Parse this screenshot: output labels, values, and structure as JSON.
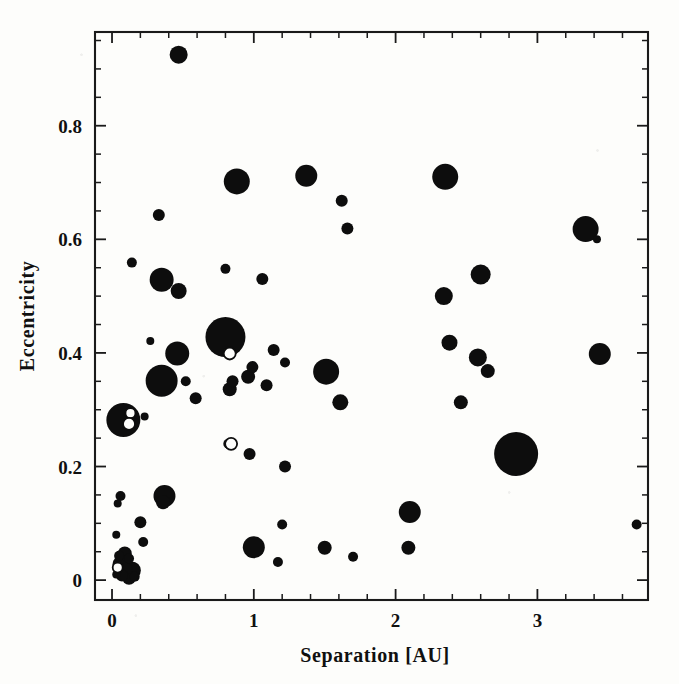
{
  "figure": {
    "background_color": "#fdfdfb",
    "ink_color": "#0d0d0d"
  },
  "chart_data": {
    "type": "scatter",
    "title": "",
    "xlabel": "Separation [AU]",
    "ylabel": "Eccentricity",
    "xlim": [
      -0.12,
      3.78
    ],
    "ylim": [
      -0.035,
      0.965
    ],
    "grid": false,
    "legend": null,
    "x_tick_labels": [
      "0",
      "1",
      "2",
      "3"
    ],
    "x_tick_values": [
      0,
      1,
      2,
      3
    ],
    "x_minor_step": 0.2,
    "y_tick_labels": [
      "0",
      "0.2",
      "0.4",
      "0.6",
      "0.8"
    ],
    "y_tick_values": [
      0,
      0.2,
      0.4,
      0.6,
      0.8
    ],
    "y_minor_step": 0.05,
    "marker_note": "Filled circles; symbol area scales with companion mass. A few small open circles overlap filled ones.",
    "points": [
      {
        "x": 0.47,
        "y": 0.925,
        "r": 9,
        "style": "filled"
      },
      {
        "x": 0.88,
        "y": 0.702,
        "r": 13,
        "style": "filled"
      },
      {
        "x": 1.37,
        "y": 0.712,
        "r": 11,
        "style": "filled"
      },
      {
        "x": 2.35,
        "y": 0.71,
        "r": 13,
        "style": "filled"
      },
      {
        "x": 1.62,
        "y": 0.668,
        "r": 6,
        "style": "filled"
      },
      {
        "x": 0.33,
        "y": 0.643,
        "r": 6,
        "style": "filled"
      },
      {
        "x": 1.66,
        "y": 0.619,
        "r": 6,
        "style": "filled"
      },
      {
        "x": 3.34,
        "y": 0.618,
        "r": 13,
        "style": "filled"
      },
      {
        "x": 3.42,
        "y": 0.6,
        "r": 4,
        "style": "filled"
      },
      {
        "x": 0.14,
        "y": 0.559,
        "r": 5,
        "style": "filled"
      },
      {
        "x": 0.8,
        "y": 0.548,
        "r": 5,
        "style": "filled"
      },
      {
        "x": 0.35,
        "y": 0.529,
        "r": 12,
        "style": "filled"
      },
      {
        "x": 1.06,
        "y": 0.53,
        "r": 6,
        "style": "filled"
      },
      {
        "x": 2.6,
        "y": 0.538,
        "r": 10,
        "style": "filled"
      },
      {
        "x": 0.47,
        "y": 0.509,
        "r": 8,
        "style": "filled"
      },
      {
        "x": 2.34,
        "y": 0.5,
        "r": 9,
        "style": "filled"
      },
      {
        "x": 0.8,
        "y": 0.428,
        "r": 20,
        "style": "filled"
      },
      {
        "x": 0.27,
        "y": 0.421,
        "r": 4,
        "style": "filled"
      },
      {
        "x": 2.38,
        "y": 0.418,
        "r": 8,
        "style": "filled"
      },
      {
        "x": 0.46,
        "y": 0.399,
        "r": 12,
        "style": "filled"
      },
      {
        "x": 0.83,
        "y": 0.399,
        "r": 6,
        "style": "open"
      },
      {
        "x": 1.14,
        "y": 0.405,
        "r": 6,
        "style": "filled"
      },
      {
        "x": 3.44,
        "y": 0.398,
        "r": 11,
        "style": "filled"
      },
      {
        "x": 2.58,
        "y": 0.392,
        "r": 9,
        "style": "filled"
      },
      {
        "x": 1.22,
        "y": 0.383,
        "r": 5,
        "style": "filled"
      },
      {
        "x": 0.99,
        "y": 0.375,
        "r": 6,
        "style": "filled"
      },
      {
        "x": 2.65,
        "y": 0.368,
        "r": 7,
        "style": "filled"
      },
      {
        "x": 1.51,
        "y": 0.367,
        "r": 13,
        "style": "filled"
      },
      {
        "x": 0.96,
        "y": 0.358,
        "r": 7,
        "style": "filled"
      },
      {
        "x": 0.35,
        "y": 0.351,
        "r": 16,
        "style": "filled"
      },
      {
        "x": 0.52,
        "y": 0.35,
        "r": 5,
        "style": "filled"
      },
      {
        "x": 0.85,
        "y": 0.35,
        "r": 6,
        "style": "filled"
      },
      {
        "x": 1.09,
        "y": 0.343,
        "r": 6,
        "style": "filled"
      },
      {
        "x": 0.83,
        "y": 0.336,
        "r": 7,
        "style": "filled"
      },
      {
        "x": 1.61,
        "y": 0.313,
        "r": 8,
        "style": "filled"
      },
      {
        "x": 2.46,
        "y": 0.313,
        "r": 7,
        "style": "filled"
      },
      {
        "x": 0.59,
        "y": 0.32,
        "r": 6,
        "style": "filled"
      },
      {
        "x": 0.08,
        "y": 0.282,
        "r": 17,
        "style": "filled"
      },
      {
        "x": 0.13,
        "y": 0.294,
        "r": 5,
        "style": "open"
      },
      {
        "x": 0.12,
        "y": 0.275,
        "r": 6,
        "style": "open"
      },
      {
        "x": 0.23,
        "y": 0.288,
        "r": 4,
        "style": "filled"
      },
      {
        "x": 0.84,
        "y": 0.24,
        "r": 6,
        "style": "open"
      },
      {
        "x": 0.82,
        "y": 0.24,
        "r": 5,
        "style": "filled"
      },
      {
        "x": 2.85,
        "y": 0.222,
        "r": 22,
        "style": "filled"
      },
      {
        "x": 0.97,
        "y": 0.222,
        "r": 6,
        "style": "filled"
      },
      {
        "x": 1.22,
        "y": 0.2,
        "r": 6,
        "style": "filled"
      },
      {
        "x": 0.37,
        "y": 0.148,
        "r": 11,
        "style": "filled"
      },
      {
        "x": 0.06,
        "y": 0.148,
        "r": 5,
        "style": "filled"
      },
      {
        "x": 0.36,
        "y": 0.137,
        "r": 7,
        "style": "filled"
      },
      {
        "x": 0.04,
        "y": 0.135,
        "r": 4,
        "style": "filled"
      },
      {
        "x": 2.1,
        "y": 0.12,
        "r": 11,
        "style": "filled"
      },
      {
        "x": 0.2,
        "y": 0.102,
        "r": 6,
        "style": "filled"
      },
      {
        "x": 1.2,
        "y": 0.098,
        "r": 5,
        "style": "filled"
      },
      {
        "x": 3.7,
        "y": 0.098,
        "r": 5,
        "style": "filled"
      },
      {
        "x": 0.03,
        "y": 0.08,
        "r": 4,
        "style": "filled"
      },
      {
        "x": 0.22,
        "y": 0.067,
        "r": 5,
        "style": "filled"
      },
      {
        "x": 1.0,
        "y": 0.058,
        "r": 11,
        "style": "filled"
      },
      {
        "x": 1.5,
        "y": 0.057,
        "r": 7,
        "style": "filled"
      },
      {
        "x": 2.09,
        "y": 0.057,
        "r": 7,
        "style": "filled"
      },
      {
        "x": 1.7,
        "y": 0.041,
        "r": 5,
        "style": "filled"
      },
      {
        "x": 1.17,
        "y": 0.032,
        "r": 5,
        "style": "filled"
      },
      {
        "x": 0.09,
        "y": 0.047,
        "r": 7,
        "style": "filled"
      },
      {
        "x": 0.05,
        "y": 0.043,
        "r": 5,
        "style": "filled"
      },
      {
        "x": 0.12,
        "y": 0.038,
        "r": 5,
        "style": "filled"
      },
      {
        "x": 0.06,
        "y": 0.028,
        "r": 8,
        "style": "filled"
      },
      {
        "x": 0.04,
        "y": 0.022,
        "r": 5,
        "style": "open"
      },
      {
        "x": 0.1,
        "y": 0.02,
        "r": 6,
        "style": "filled"
      },
      {
        "x": 0.14,
        "y": 0.017,
        "r": 9,
        "style": "filled"
      },
      {
        "x": 0.07,
        "y": 0.008,
        "r": 6,
        "style": "filled"
      },
      {
        "x": 0.12,
        "y": 0.004,
        "r": 7,
        "style": "filled"
      },
      {
        "x": 0.16,
        "y": 0.006,
        "r": 5,
        "style": "filled"
      },
      {
        "x": 0.03,
        "y": 0.01,
        "r": 4,
        "style": "filled"
      }
    ]
  }
}
